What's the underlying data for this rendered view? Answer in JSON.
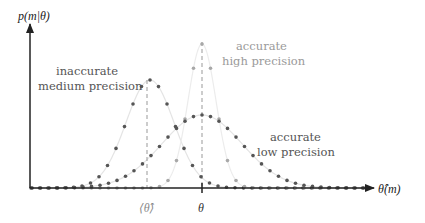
{
  "chart_data": {
    "type": "scatter",
    "title": "",
    "xlabel": "θ̂(m)",
    "ylabel": "p(m|θ)",
    "grid": false,
    "legend": "inline annotations",
    "x_ticks": [
      {
        "label": "⟨θ̂⟩",
        "position": 147
      },
      {
        "label": "θ",
        "position": 202
      }
    ],
    "series": [
      {
        "name": "inaccurate medium precision",
        "color": "#555555",
        "line_color": "#e4e4e4",
        "center_px": 150,
        "peak_px_height": 108,
        "sigma_px": 24,
        "annotation": [
          "inaccurate",
          "medium precision"
        ]
      },
      {
        "name": "accurate high precision",
        "color": "#a8a8a8",
        "line_color": "#ececec",
        "center_px": 202,
        "peak_px_height": 144,
        "sigma_px": 14,
        "annotation": [
          "accurate",
          "high precision"
        ]
      },
      {
        "name": "accurate low precision",
        "color": "#555555",
        "line_color": "#e4e4e4",
        "center_px": 202,
        "peak_px_height": 73,
        "sigma_px": 40,
        "annotation": [
          "accurate",
          "low precision"
        ]
      }
    ]
  },
  "labels": {
    "y_axis": "p(m|θ)",
    "x_axis": "θ̂(m)",
    "tick_mean": "⟨θ̂⟩",
    "tick_true": "θ",
    "medium": {
      "line1": "inaccurate",
      "line2": "medium precision"
    },
    "high": {
      "line1": "accurate",
      "line2": "high precision"
    },
    "low": {
      "line1": "accurate",
      "line2": "low precision"
    }
  }
}
